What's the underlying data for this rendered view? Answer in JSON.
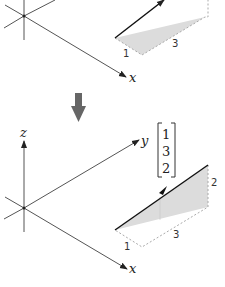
{
  "top_diagram": {
    "axis_labels": {
      "x": "x"
    },
    "edge_labels": {
      "a": "1",
      "b": "3"
    }
  },
  "transition_arrow": {
    "icon": "down-arrow-icon",
    "color": "#666666"
  },
  "bottom_diagram": {
    "axis_labels": {
      "x": "x",
      "y": "y",
      "z": "z"
    },
    "vector": [
      "1",
      "3",
      "2"
    ],
    "edge_labels": {
      "a": "1",
      "b": "3",
      "c": "2"
    }
  },
  "colors": {
    "axis": "#444444",
    "vector": "#111111",
    "shade": "#d9d9d9",
    "dash": "#aaaaaa"
  }
}
